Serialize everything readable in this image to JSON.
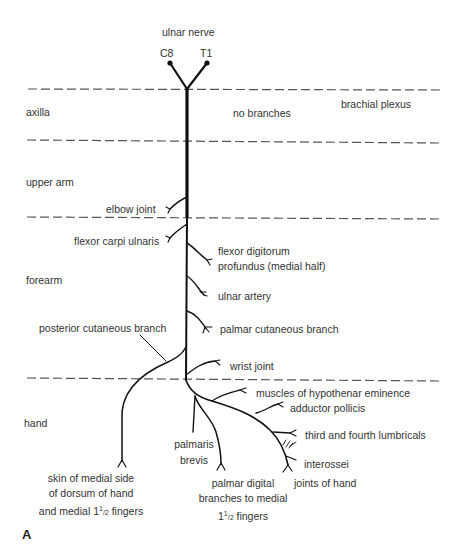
{
  "title": "ulnar nerve",
  "roots": [
    "C8",
    "T1"
  ],
  "regions": [
    {
      "name": "axilla"
    },
    {
      "name": "upper arm"
    },
    {
      "name": "forearm"
    },
    {
      "name": "hand"
    }
  ],
  "annotations": {
    "brachial_plexus": "brachial plexus",
    "no_branches": "no branches"
  },
  "branches": {
    "elbow_joint": "elbow joint",
    "flexor_carpi_ulnaris": "flexor carpi ulnaris",
    "flexor_digitorum_1": "flexor digitorum",
    "flexor_digitorum_2": "profundus (medial half)",
    "ulnar_artery": "ulnar artery",
    "posterior_cutaneous": "posterior cutaneous branch",
    "palmar_cutaneous": "palmar cutaneous branch",
    "wrist_joint": "wrist joint",
    "hypothenar": "muscles of hypothenar eminence",
    "adductor_pollicis": "adductor pollicis",
    "lumbricals": "third and fourth lumbricals",
    "interossei": "interossei",
    "joints_of_hand": "joints of hand",
    "palmaris_1": "palmaris",
    "palmaris_2": "brevis",
    "skin_1": "skin of medial side",
    "skin_2": "of dorsum of hand",
    "skin_3_pre": "and medial 1",
    "skin_3_sup": "1",
    "skin_3_sub": "/2",
    "skin_3_post": " fingers",
    "digital_1": "palmar digital",
    "digital_2": "branches to medial",
    "digital_3_pre": "1",
    "digital_3_sup": "1",
    "digital_3_sub": "/2",
    "digital_3_post": " fingers"
  },
  "figure_label": "A",
  "colors": {
    "line": "#111111",
    "dash": "#555555",
    "text": "#333333"
  }
}
